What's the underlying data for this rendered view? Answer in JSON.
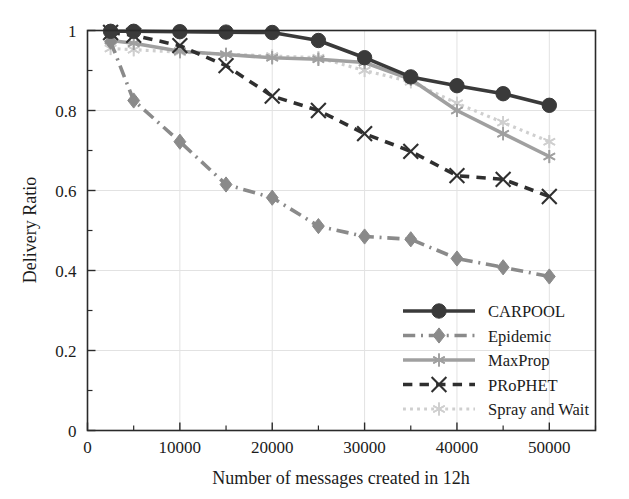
{
  "chart_data": {
    "type": "line",
    "title": "",
    "xlabel": "Number of messages created in 12h",
    "ylabel": "Delivery Ratio",
    "xlim": [
      0,
      55000
    ],
    "ylim": [
      0,
      1
    ],
    "xticks": [
      0,
      10000,
      20000,
      30000,
      40000,
      50000
    ],
    "xticklabels": [
      "0",
      "10000",
      "20000",
      "30000",
      "40000",
      "50000"
    ],
    "xticks_minor": [
      5000,
      15000,
      25000,
      35000,
      45000,
      55000
    ],
    "yticks": [
      0,
      0.2,
      0.4,
      0.6,
      0.8,
      1
    ],
    "yticklabels": [
      "0",
      "0.2",
      "0.4",
      "0.6",
      "0.8",
      "1"
    ],
    "yticks_minor": [
      0.1,
      0.3,
      0.5,
      0.7,
      0.9
    ],
    "grid": true,
    "legend_position": "lower right",
    "x": [
      2500,
      5000,
      10000,
      15000,
      20000,
      25000,
      30000,
      35000,
      40000,
      45000,
      50000
    ],
    "series": [
      {
        "name": "CARPOOL",
        "color": "#3a3a3a",
        "marker": "circle",
        "linestyle": "solid",
        "values": [
          0.998,
          0.998,
          0.997,
          0.996,
          0.995,
          0.975,
          0.932,
          0.884,
          0.862,
          0.842,
          0.813
        ]
      },
      {
        "name": "Epidemic",
        "color": "#8a8a8a",
        "marker": "diamond",
        "linestyle": "dashdot",
        "values": [
          0.972,
          0.825,
          0.722,
          0.615,
          0.582,
          0.511,
          0.485,
          0.478,
          0.43,
          0.408,
          0.385
        ]
      },
      {
        "name": "MaxProp",
        "color": "#a0a0a0",
        "marker": "asterisk",
        "linestyle": "solid",
        "values": [
          0.975,
          0.968,
          0.948,
          0.94,
          0.932,
          0.928,
          0.92,
          0.878,
          0.8,
          0.742,
          0.685
        ]
      },
      {
        "name": "PRoPHET",
        "color": "#2f2f2f",
        "marker": "x",
        "linestyle": "dashed",
        "values": [
          0.995,
          0.988,
          0.962,
          0.912,
          0.836,
          0.8,
          0.742,
          0.698,
          0.637,
          0.628,
          0.585
        ]
      },
      {
        "name": "Spray and Wait",
        "color": "#cfcfcf",
        "marker": "asterisk",
        "linestyle": "dotted",
        "values": [
          0.955,
          0.952,
          0.946,
          0.941,
          0.936,
          0.932,
          0.9,
          0.872,
          0.818,
          0.77,
          0.722
        ]
      }
    ],
    "legend_entries": [
      "CARPOOL",
      "Epidemic",
      "MaxProp",
      "PRoPHET",
      "Spray and Wait"
    ]
  }
}
